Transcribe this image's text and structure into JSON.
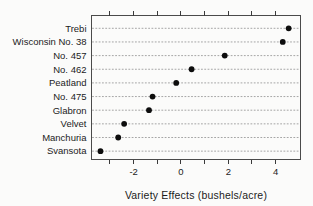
{
  "figure": {
    "background": "#fbfbfa",
    "kind": "statistical dot plot"
  },
  "chart_data": {
    "type": "scatter",
    "subtype": "cleveland-dotplot",
    "title": "",
    "xlabel": "Variety Effects (bushels/acre)",
    "ylabel": "",
    "categories": [
      "Trebi",
      "Wisconsin No. 38",
      "No. 457",
      "No. 462",
      "Peatland",
      "No. 475",
      "Glabron",
      "Velvet",
      "Manchuria",
      "Svansota"
    ],
    "values": [
      4.55,
      4.3,
      1.85,
      0.45,
      -0.2,
      -1.2,
      -1.35,
      -2.4,
      -2.65,
      -3.4
    ],
    "xlim": [
      -3.8,
      5.05
    ],
    "xticks_minor": [
      -3,
      -2,
      -1,
      0,
      1,
      2,
      3,
      4
    ],
    "xticks_labeled": [
      -2,
      0,
      2,
      4
    ],
    "xtick_labels": [
      "-2",
      "0",
      "2",
      "4"
    ],
    "grid": "horizontal-dotted",
    "legend": "none",
    "colors": {
      "dot": "#0d0d0d",
      "grid_line": "#9c9c9c",
      "box_border": "#4a4a4a",
      "tick": "#3a3a3a",
      "text": "#1c1c1c"
    }
  }
}
